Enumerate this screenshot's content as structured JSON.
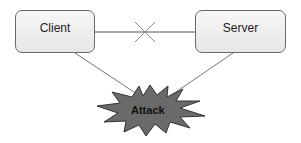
{
  "diagram": {
    "nodes": [
      {
        "id": "client",
        "label": "Client"
      },
      {
        "id": "server",
        "label": "Server"
      },
      {
        "id": "attack",
        "label": "Attack"
      }
    ],
    "edges": [
      {
        "from": "client",
        "to": "server",
        "style": "blocked",
        "marker": "cross"
      },
      {
        "from": "client",
        "to": "attack",
        "style": "line"
      },
      {
        "from": "server",
        "to": "attack",
        "style": "line"
      }
    ],
    "colors": {
      "box_border": "#6a6a6a",
      "box_fill": "#eeeeee",
      "attack_fill": "#666666",
      "line": "#555555"
    }
  }
}
